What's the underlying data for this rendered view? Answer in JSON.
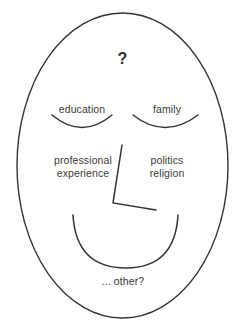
{
  "diagram": {
    "title_glyph": "?",
    "face": {
      "outline_name": "face-oval",
      "stroke_color": "#333333",
      "background_color": "#ffffff"
    },
    "labels": {
      "question": "?",
      "left_eye": "education",
      "right_eye": "family",
      "left_cheek": "professional\nexperience",
      "right_cheek": "politics\nreligion",
      "mouth_below": "... other?"
    },
    "features": [
      {
        "name": "left-eye-arc",
        "label": "education"
      },
      {
        "name": "right-eye-arc",
        "label": "family"
      },
      {
        "name": "nose-polyline",
        "label": ""
      },
      {
        "name": "mouth-smile-arc",
        "label": "... other?"
      }
    ]
  }
}
